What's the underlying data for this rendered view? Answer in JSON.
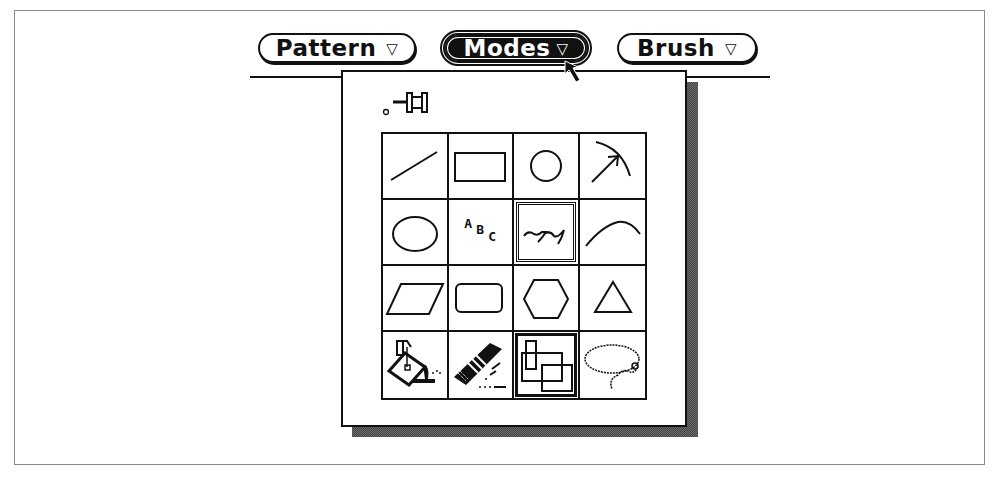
{
  "menubar": {
    "buttons": [
      {
        "id": "pattern",
        "label": "Pattern",
        "indicator": "▽",
        "active": false
      },
      {
        "id": "modes",
        "label": "Modes",
        "indicator": "▽",
        "active": true
      },
      {
        "id": "brush",
        "label": "Brush",
        "indicator": "▽",
        "active": false
      }
    ]
  },
  "modes_menu": {
    "pin_icon": "pushpin-icon",
    "tools": [
      {
        "name": "line",
        "icon": "line-icon",
        "selected": false
      },
      {
        "name": "rectangle",
        "icon": "rectangle-icon",
        "selected": false
      },
      {
        "name": "circle",
        "icon": "circle-icon",
        "selected": false
      },
      {
        "name": "arc-arrow",
        "icon": "arc-arrow-icon",
        "selected": false
      },
      {
        "name": "ellipse",
        "icon": "ellipse-icon",
        "selected": false
      },
      {
        "name": "text",
        "icon": "text-icon",
        "text": {
          "a": "A",
          "b": "B",
          "c": "C"
        },
        "selected": false
      },
      {
        "name": "freehand",
        "icon": "freehand-icon",
        "selected": true
      },
      {
        "name": "curve",
        "icon": "curve-icon",
        "selected": false
      },
      {
        "name": "parallelogram",
        "icon": "parallelogram-icon",
        "selected": false
      },
      {
        "name": "rounded-rectangle",
        "icon": "rounded-rectangle-icon",
        "selected": false
      },
      {
        "name": "hexagon",
        "icon": "hexagon-icon",
        "selected": false
      },
      {
        "name": "triangle",
        "icon": "triangle-icon",
        "selected": false
      },
      {
        "name": "paint-bucket",
        "icon": "paint-bucket-icon",
        "selected": false
      },
      {
        "name": "airbrush",
        "icon": "airbrush-icon",
        "selected": false
      },
      {
        "name": "select-move",
        "icon": "overlapping-rectangles-icon",
        "selected": true
      },
      {
        "name": "lasso",
        "icon": "lasso-icon",
        "selected": false
      }
    ]
  },
  "colors": {
    "ink": "#111111",
    "paper": "#ffffff",
    "frame": "#8a8a8a"
  }
}
